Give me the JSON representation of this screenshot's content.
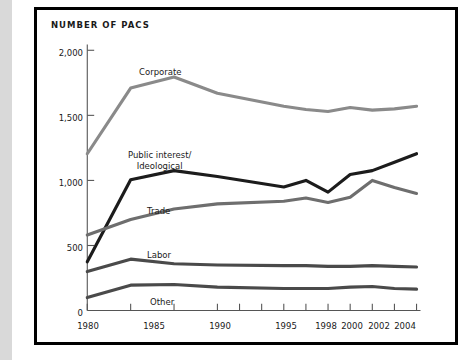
{
  "chart_title": "NUMBER OF PACS",
  "axis": {
    "y_ticks": [
      "0",
      "500",
      "1,000",
      "1,500",
      "2,000"
    ],
    "x_ticks": [
      "1980",
      "1985",
      "1990",
      "1995",
      "1998",
      "2000",
      "2002",
      "2004"
    ]
  },
  "series_labels": {
    "corporate": "Corporate",
    "public_interest_line1": "Public interest/",
    "public_interest_line2": "Ideological",
    "trade": "Trade",
    "labor": "Labor",
    "other": "Other"
  },
  "colors": {
    "corporate": "#8a8a8a",
    "public_interest": "#1c1c1c",
    "trade": "#6e6e6e",
    "labor": "#4a4a4a",
    "other": "#4a4a4a",
    "axis": "#555555",
    "text": "#1a1a1a",
    "frame": "#000000",
    "gutter": "#d9d9d9"
  },
  "chart_data": {
    "type": "line",
    "title": "NUMBER OF PACS",
    "xlabel": "",
    "ylabel": "Number of PACs",
    "xlim": [
      1980,
      2004
    ],
    "ylim": [
      0,
      2000
    ],
    "yticks": [
      0,
      500,
      1000,
      1500,
      2000
    ],
    "xticks": [
      1980,
      1985,
      1990,
      1995,
      1998,
      2000,
      2002,
      2004
    ],
    "minor_xticks": [
      1996,
      1997,
      1998,
      1999,
      2000,
      2001,
      2002,
      2003,
      2004
    ],
    "grid": false,
    "legend": "inline-labels",
    "x": [
      1980,
      1985,
      1990,
      1995,
      1998,
      1999,
      2000,
      2001,
      2002,
      2003,
      2004
    ],
    "series": [
      {
        "name": "Corporate",
        "color": "#8a8a8a",
        "values": [
          1205,
          1710,
          1795,
          1670,
          1570,
          1545,
          1530,
          1560,
          1540,
          1550,
          1570
        ]
      },
      {
        "name": "Public interest/Ideological",
        "color": "#1c1c1c",
        "values": [
          375,
          1005,
          1075,
          1030,
          950,
          1000,
          910,
          1045,
          1075,
          1140,
          1205
        ]
      },
      {
        "name": "Trade",
        "color": "#6e6e6e",
        "values": [
          580,
          700,
          780,
          820,
          840,
          865,
          830,
          870,
          1000,
          945,
          900
        ]
      },
      {
        "name": "Labor",
        "color": "#4a4a4a",
        "values": [
          300,
          395,
          360,
          350,
          345,
          345,
          340,
          340,
          345,
          340,
          335
        ]
      },
      {
        "name": "Other",
        "color": "#4a4a4a",
        "values": [
          100,
          195,
          200,
          180,
          170,
          170,
          170,
          180,
          185,
          170,
          165
        ]
      }
    ]
  }
}
